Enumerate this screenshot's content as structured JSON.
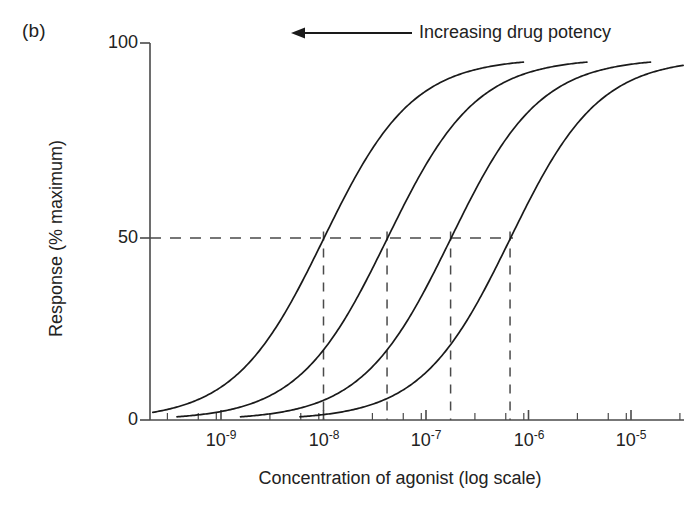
{
  "panel": {
    "label": "(b)"
  },
  "annotation": {
    "text": "Increasing drug potency",
    "arrow_direction": "left"
  },
  "axes": {
    "y_title": "Response (% maximum)",
    "x_title": "Concentration of agonist (log scale)",
    "y_ticks": [
      "0",
      "50",
      "100"
    ],
    "x_ticks": [
      "10",
      "10",
      "10",
      "10",
      "10"
    ],
    "x_tick_exponents": [
      "-9",
      "-8",
      "-7",
      "-6",
      "-5"
    ]
  },
  "chart_data": {
    "type": "line",
    "title": "Increasing drug potency",
    "xlabel": "Concentration of agonist (log scale)",
    "ylabel": "Response (% maximum)",
    "xscale": "log",
    "xlim": [
      -9.7,
      -4.8
    ],
    "ylim": [
      0,
      100
    ],
    "grid": false,
    "legend_position": "none",
    "x_tick_values": [
      1e-09,
      1e-08,
      1e-07,
      1e-06,
      1e-05
    ],
    "x_tick_labels": [
      "10^-9",
      "10^-8",
      "10^-7",
      "10^-6",
      "10^-5"
    ],
    "y_tick_values": [
      0,
      50,
      100
    ],
    "y_tick_labels": [
      "0",
      "50",
      "100"
    ],
    "reference_lines": [
      {
        "orientation": "horizontal",
        "value": 50,
        "style": "dashed",
        "label": "50% maximal response"
      }
    ],
    "series": [
      {
        "name": "Drug 1 (most potent)",
        "ec50_log10": -8.0,
        "ec50": 1e-08,
        "hill_slope": 1.0,
        "emax": 96,
        "ec50_marker": {
          "style": "dashed-vertical",
          "from_y": 50,
          "to_y": 0
        }
      },
      {
        "name": "Drug 2",
        "ec50_log10": -7.38,
        "ec50": 4.2e-08,
        "hill_slope": 1.0,
        "emax": 96,
        "ec50_marker": {
          "style": "dashed-vertical",
          "from_y": 50,
          "to_y": 0
        }
      },
      {
        "name": "Drug 3",
        "ec50_log10": -6.76,
        "ec50": 1.7e-07,
        "hill_slope": 1.0,
        "emax": 96,
        "ec50_marker": {
          "style": "dashed-vertical",
          "from_y": 50,
          "to_y": 0
        }
      },
      {
        "name": "Drug 4 (least potent)",
        "ec50_log10": -6.18,
        "ec50": 6.6e-07,
        "hill_slope": 1.0,
        "emax": 96,
        "ec50_marker": {
          "style": "dashed-vertical",
          "from_y": 50,
          "to_y": 0
        }
      }
    ],
    "annotations": [
      {
        "text": "Increasing drug potency",
        "arrow": "left",
        "x_start": -5.6,
        "x_end": -7.3,
        "y": 99
      }
    ]
  },
  "colors": {
    "curve": "#1a1a1a",
    "axis": "#4a4a4a",
    "dash": "#4a4a4a",
    "background": "#ffffff"
  }
}
